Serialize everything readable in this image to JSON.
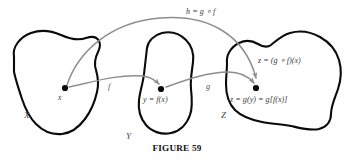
{
  "figure": {
    "caption": "FIGURE 59"
  },
  "sets": [
    {
      "id": "X",
      "label": "X"
    },
    {
      "id": "Y",
      "label": "Y"
    },
    {
      "id": "Z",
      "label": "Z"
    }
  ],
  "points": [
    {
      "id": "x",
      "label": "x",
      "set": "X"
    },
    {
      "id": "y",
      "label": "y = f(x)",
      "set": "Y"
    },
    {
      "id": "z",
      "label": "z = g(y) = g[f(x)]",
      "set": "Z"
    }
  ],
  "annotations": [
    {
      "id": "z-composite",
      "label": "z = (g ∘ f)(x)",
      "set": "Z"
    }
  ],
  "arrows": [
    {
      "id": "f",
      "label": "f",
      "from": "x",
      "to": "y"
    },
    {
      "id": "g",
      "label": "g",
      "from": "y",
      "to": "z"
    },
    {
      "id": "h",
      "label": "h = g ∘ f",
      "from": "x",
      "to": "z"
    }
  ],
  "colors": {
    "blob_stroke": "#0a0a0a",
    "arrow_stroke": "#8e8e8e",
    "dot_fill": "#0a0a0a",
    "background": "#ffffff",
    "text": "#1a1a1a"
  }
}
